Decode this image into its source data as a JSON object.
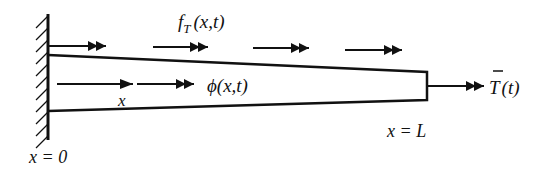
{
  "diagram": {
    "labels": {
      "distributed_torque": "f",
      "distributed_torque_sub": "T",
      "distributed_torque_args": "(x,t)",
      "twist_angle": "ϕ(x,t)",
      "coordinate": "x",
      "left_end": "x = 0",
      "right_end": "x = L",
      "end_torque_symbol": "T",
      "end_torque_args": "(t)"
    },
    "elements": {
      "fixed_wall": "clamped support at x = 0",
      "bar": "tapered bar, wide at left, narrow at right",
      "top_arrows_count": 4,
      "end_arrow": "applied end torque at x = L"
    },
    "colors": {
      "stroke": "#111111",
      "background": "#ffffff"
    }
  }
}
